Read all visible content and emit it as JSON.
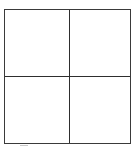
{
  "diagram": {
    "type": "2x2-grid",
    "rows": 2,
    "columns": 2,
    "line_color": "#2e2e2e",
    "background_color": "#ffffff",
    "cells": [
      {
        "position": "top-left",
        "label": ""
      },
      {
        "position": "top-right",
        "label": ""
      },
      {
        "position": "bottom-left",
        "label": ""
      },
      {
        "position": "bottom-right",
        "label": ""
      }
    ]
  }
}
